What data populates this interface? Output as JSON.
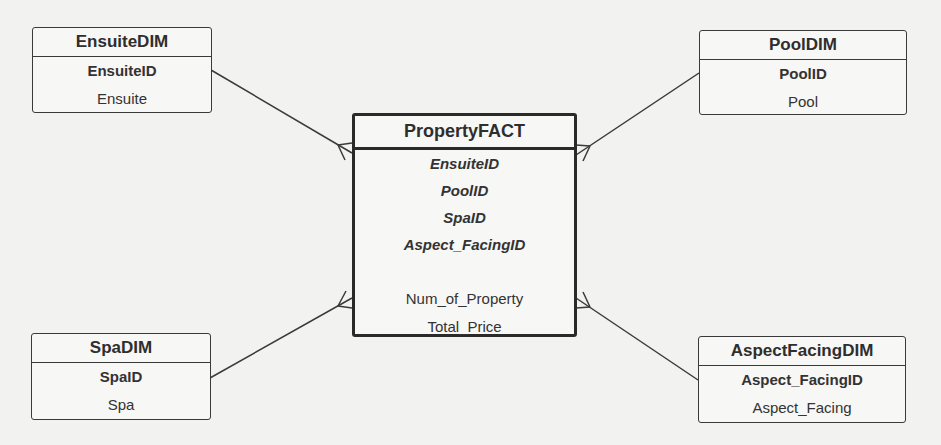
{
  "diagram": {
    "type": "star-schema",
    "fact": {
      "title": "PropertyFACT",
      "foreign_keys": [
        "EnsuiteID",
        "PoolID",
        "SpaID",
        "Aspect_FacingID"
      ],
      "measures": [
        "Num_of_Property",
        "Total_Price"
      ]
    },
    "dimensions": {
      "ensuite": {
        "title": "EnsuiteDIM",
        "key": "EnsuiteID",
        "attribute": "Ensuite"
      },
      "pool": {
        "title": "PoolDIM",
        "key": "PoolID",
        "attribute": "Pool"
      },
      "spa": {
        "title": "SpaDIM",
        "key": "SpaID",
        "attribute": "Spa"
      },
      "aspect_facing": {
        "title": "AspectFacingDIM",
        "key": "Aspect_FacingID",
        "attribute": "Aspect_Facing"
      }
    },
    "relationships": [
      {
        "from": "EnsuiteDIM",
        "to": "PropertyFACT",
        "cardinality": "one-to-many"
      },
      {
        "from": "PoolDIM",
        "to": "PropertyFACT",
        "cardinality": "one-to-many"
      },
      {
        "from": "SpaDIM",
        "to": "PropertyFACT",
        "cardinality": "one-to-many"
      },
      {
        "from": "AspectFacingDIM",
        "to": "PropertyFACT",
        "cardinality": "one-to-many"
      }
    ],
    "colors": {
      "line": "#3a3a3a",
      "background": "#f2f2f0"
    }
  }
}
